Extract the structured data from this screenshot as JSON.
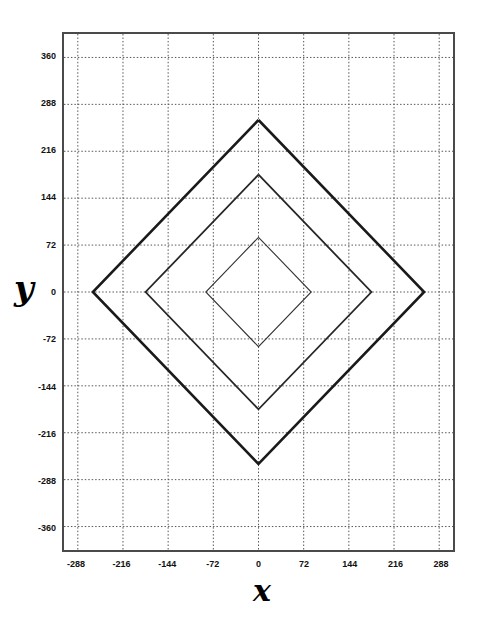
{
  "chart_data": {
    "type": "line",
    "title": "",
    "xlabel": "x",
    "ylabel": "y",
    "xlim": [
      -310,
      310
    ],
    "ylim": [
      -396,
      396
    ],
    "xticks": [
      -288,
      -216,
      -144,
      -72,
      0,
      72,
      144,
      216,
      288
    ],
    "yticks": [
      360,
      288,
      216,
      144,
      72,
      0,
      -72,
      -144,
      -216,
      -288,
      -360
    ],
    "xtick_labels": [
      "-288",
      "-216",
      "-144",
      "-72",
      "0",
      "72",
      "144",
      "216",
      "288"
    ],
    "ytick_labels": [
      "360",
      "288",
      "216",
      "144",
      "72",
      "0",
      "-72",
      "-144",
      "-216",
      "-288",
      "-360"
    ],
    "grid": true,
    "grid_style": "dotted",
    "grid_color": "#555555",
    "legend": "none",
    "background": "#ffffff",
    "frame_color": "#4a4a4a",
    "series": [
      {
        "name": "outer-diamond",
        "shape": "diamond",
        "x_vertex": 264,
        "y_vertex": 264,
        "line_color": "#1a1a1a",
        "line_width": 2.6,
        "points": [
          {
            "x": 0,
            "y": 264
          },
          {
            "x": 264,
            "y": 0
          },
          {
            "x": 0,
            "y": -264
          },
          {
            "x": -264,
            "y": 0
          },
          {
            "x": 0,
            "y": 264
          }
        ]
      },
      {
        "name": "middle-diamond",
        "shape": "diamond",
        "x_vertex": 180,
        "y_vertex": 180,
        "line_color": "#262626",
        "line_width": 1.8,
        "points": [
          {
            "x": 0,
            "y": 180
          },
          {
            "x": 180,
            "y": 0
          },
          {
            "x": 0,
            "y": -180
          },
          {
            "x": -180,
            "y": 0
          },
          {
            "x": 0,
            "y": 180
          }
        ]
      },
      {
        "name": "inner-diamond",
        "shape": "diamond",
        "x_vertex": 84,
        "y_vertex": 84,
        "line_color": "#333333",
        "line_width": 1.1,
        "points": [
          {
            "x": 0,
            "y": 84
          },
          {
            "x": 84,
            "y": 0
          },
          {
            "x": 0,
            "y": -84
          },
          {
            "x": -84,
            "y": 0
          },
          {
            "x": 0,
            "y": 84
          }
        ]
      }
    ]
  },
  "axes": {
    "y_title": "y",
    "x_title": "x"
  }
}
